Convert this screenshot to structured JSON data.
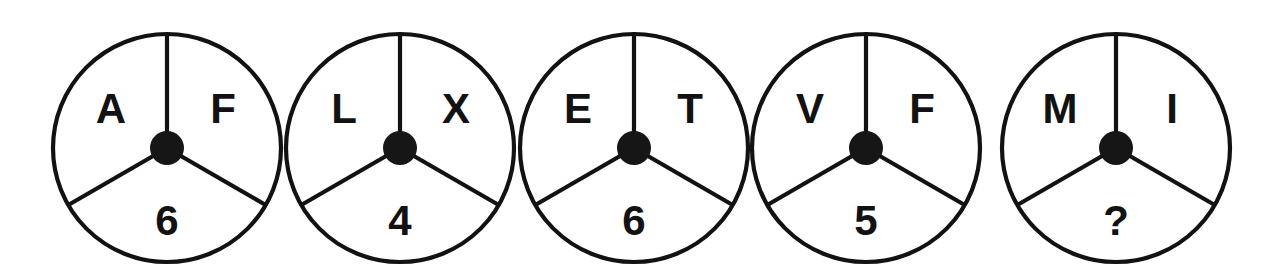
{
  "figure": {
    "kind": "puzzle-wheel-row",
    "background_color": "#ffffff",
    "ink_color": "#121212",
    "count": 5
  },
  "wheels": [
    {
      "index": 1,
      "top_left_letter": "A",
      "top_right_letter": "F",
      "bottom_value": "6",
      "cx": 167,
      "cy": 148,
      "r": 114,
      "hub_r": 17
    },
    {
      "index": 2,
      "top_left_letter": "L",
      "top_right_letter": "X",
      "bottom_value": "4",
      "cx": 400,
      "cy": 148,
      "r": 114,
      "hub_r": 17
    },
    {
      "index": 3,
      "top_left_letter": "E",
      "top_right_letter": "T",
      "bottom_value": "6",
      "cx": 634,
      "cy": 148,
      "r": 114,
      "hub_r": 17
    },
    {
      "index": 4,
      "top_left_letter": "V",
      "top_right_letter": "F",
      "bottom_value": "5",
      "cx": 866,
      "cy": 148,
      "r": 114,
      "hub_r": 17
    },
    {
      "index": 5,
      "top_left_letter": "M",
      "top_right_letter": "I",
      "bottom_value": "?",
      "cx": 1116,
      "cy": 148,
      "r": 114,
      "hub_r": 17
    }
  ]
}
